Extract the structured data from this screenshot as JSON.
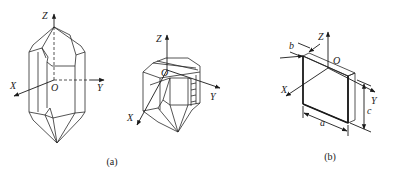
{
  "figure": {
    "panels": [
      {
        "id": "a",
        "caption": "(a)",
        "description": "Quartz crystal drawings with crystallographic axes",
        "crystal1": {
          "axes": {
            "z": "Z",
            "x": "X",
            "y": "Y",
            "origin": "O"
          }
        },
        "crystal2": {
          "axes": {
            "z": "Z",
            "x": "X",
            "y": "Y",
            "origin": "O"
          }
        }
      },
      {
        "id": "b",
        "caption": "(b)",
        "description": "Rectangular plate cut from crystal with dimensions",
        "axes": {
          "z": "Z",
          "x": "X",
          "y": "Y",
          "origin": "O"
        },
        "dimensions": {
          "thickness": "b",
          "length": "a",
          "height": "c"
        }
      }
    ],
    "colors": {
      "line": "#1a1a1a",
      "background": "#ffffff"
    }
  }
}
